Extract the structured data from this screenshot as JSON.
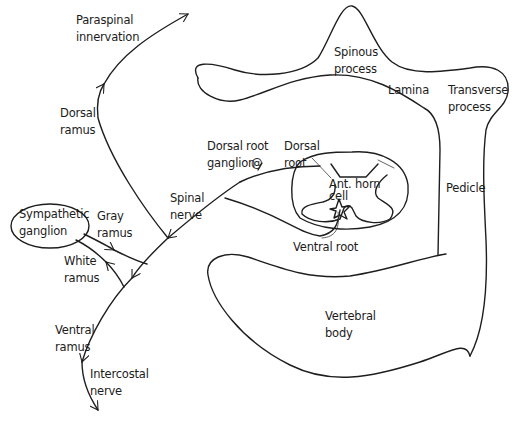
{
  "figure": {
    "type": "anatomical-diagram",
    "stroke_color": "#1e1e1e",
    "background": "#ffffff"
  },
  "labels": {
    "paraspinal": "Paraspinal\ninnervation",
    "dorsal_ramus": "Dorsal\nramus",
    "spinous_process": "Spinous\nprocess",
    "lamina": "Lamina",
    "transverse_process": "Transverse\nprocess",
    "dorsal_root_ganglion": "Dorsal root\nganglion",
    "dorsal_root": "Dorsal\nroot",
    "ant_horn_cell": "Ant. horn\ncell",
    "pedicle": "Pedicle",
    "spinal_nerve": "Spinal\nnerve",
    "sympathetic_ganglion": "Sympathetic\nganglion",
    "gray_ramus": "Gray\nramus",
    "white_ramus": "White\nramus",
    "ventral_root": "Ventral root",
    "ventral_ramus": "Ventral\nramus",
    "vertebral_body": "Vertebral\nbody",
    "intercostal_nerve": "Intercostal\nnerve"
  },
  "icons": {
    "ganglion_marker": "@",
    "anterior_horn_cell": "star-shaped-neuron"
  }
}
